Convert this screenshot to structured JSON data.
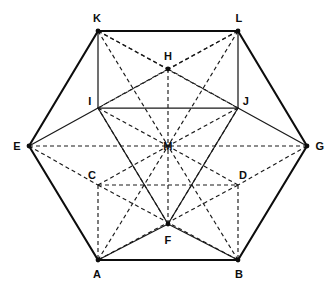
{
  "figure": {
    "background_color": "#ffffff",
    "line_color": "#1a1a1a",
    "outer_line_color": "#0d0d0d",
    "width": 332,
    "height": 286,
    "vertices": [
      {
        "id": "A",
        "label": "A",
        "x": 98,
        "y": 260,
        "label_x": 97,
        "label_y": 274,
        "dot": true
      },
      {
        "id": "B",
        "label": "B",
        "x": 238,
        "y": 260,
        "label_x": 239,
        "label_y": 274,
        "dot": true
      },
      {
        "id": "C",
        "label": "C",
        "x": 98,
        "y": 185,
        "label_x": 92,
        "label_y": 175,
        "dot": false
      },
      {
        "id": "D",
        "label": "D",
        "x": 238,
        "y": 185,
        "label_x": 243,
        "label_y": 175,
        "dot": false
      },
      {
        "id": "E",
        "label": "E",
        "x": 29,
        "y": 146,
        "label_x": 17,
        "label_y": 146,
        "dot": true
      },
      {
        "id": "F",
        "label": "F",
        "x": 168,
        "y": 224,
        "label_x": 168,
        "label_y": 240,
        "dot": true
      },
      {
        "id": "G",
        "label": "G",
        "x": 307,
        "y": 146,
        "label_x": 320,
        "label_y": 146,
        "dot": true
      },
      {
        "id": "H",
        "label": "H",
        "x": 168,
        "y": 69,
        "label_x": 168,
        "label_y": 56,
        "dot": true
      },
      {
        "id": "I",
        "label": "I",
        "x": 98,
        "y": 108,
        "label_x": 90,
        "label_y": 101,
        "dot": false
      },
      {
        "id": "J",
        "label": "J",
        "x": 238,
        "y": 108,
        "label_x": 246,
        "label_y": 101,
        "dot": false
      },
      {
        "id": "K",
        "label": "K",
        "x": 98,
        "y": 31,
        "label_x": 97,
        "label_y": 18,
        "dot": true
      },
      {
        "id": "L",
        "label": "L",
        "x": 238,
        "y": 31,
        "label_x": 239,
        "label_y": 18,
        "dot": true
      },
      {
        "id": "M",
        "label": "M",
        "x": 168,
        "y": 146,
        "label_x": 168,
        "label_y": 146,
        "dot": false
      }
    ],
    "edges_solid_outer": [
      {
        "from": "A",
        "to": "B",
        "name": "edge-A-B"
      },
      {
        "from": "B",
        "to": "G",
        "name": "edge-B-G"
      },
      {
        "from": "G",
        "to": "L",
        "name": "edge-G-L"
      },
      {
        "from": "L",
        "to": "K",
        "name": "edge-L-K"
      },
      {
        "from": "K",
        "to": "E",
        "name": "edge-K-E"
      },
      {
        "from": "E",
        "to": "A",
        "name": "edge-E-A"
      }
    ],
    "edges_solid_inner": [
      {
        "from": "K",
        "to": "I",
        "name": "edge-K-I"
      },
      {
        "from": "L",
        "to": "J",
        "name": "edge-L-J"
      },
      {
        "from": "I",
        "to": "J",
        "name": "edge-I-J"
      },
      {
        "from": "E",
        "to": "I",
        "name": "edge-E-I"
      },
      {
        "from": "G",
        "to": "J",
        "name": "edge-G-J"
      },
      {
        "from": "I",
        "to": "F",
        "name": "edge-I-F"
      },
      {
        "from": "J",
        "to": "F",
        "name": "edge-J-F"
      },
      {
        "from": "A",
        "to": "F",
        "name": "edge-A-F"
      },
      {
        "from": "B",
        "to": "F",
        "name": "edge-B-F"
      }
    ],
    "edges_dashed": [
      {
        "from": "K",
        "to": "H",
        "name": "edge-K-H"
      },
      {
        "from": "L",
        "to": "H",
        "name": "edge-L-H"
      },
      {
        "from": "K",
        "to": "J",
        "name": "edge-K-J"
      },
      {
        "from": "L",
        "to": "I",
        "name": "edge-L-I"
      },
      {
        "from": "K",
        "to": "M",
        "name": "edge-K-M"
      },
      {
        "from": "L",
        "to": "M",
        "name": "edge-L-M"
      },
      {
        "from": "H",
        "to": "M",
        "name": "edge-H-M"
      },
      {
        "from": "H",
        "to": "I",
        "name": "edge-H-I"
      },
      {
        "from": "H",
        "to": "J",
        "name": "edge-H-J"
      },
      {
        "from": "E",
        "to": "M",
        "name": "edge-E-M"
      },
      {
        "from": "G",
        "to": "M",
        "name": "edge-G-M"
      },
      {
        "from": "E",
        "to": "C",
        "name": "edge-E-C"
      },
      {
        "from": "G",
        "to": "D",
        "name": "edge-G-D"
      },
      {
        "from": "C",
        "to": "D",
        "name": "edge-C-D"
      },
      {
        "from": "C",
        "to": "A",
        "name": "edge-C-A"
      },
      {
        "from": "D",
        "to": "B",
        "name": "edge-D-B"
      },
      {
        "from": "C",
        "to": "M",
        "name": "edge-C-M"
      },
      {
        "from": "D",
        "to": "M",
        "name": "edge-D-M"
      },
      {
        "from": "C",
        "to": "B",
        "name": "edge-C-B"
      },
      {
        "from": "D",
        "to": "A",
        "name": "edge-D-A"
      },
      {
        "from": "F",
        "to": "M",
        "name": "edge-F-M"
      },
      {
        "from": "A",
        "to": "M",
        "name": "edge-A-M"
      },
      {
        "from": "B",
        "to": "M",
        "name": "edge-B-M"
      },
      {
        "from": "I",
        "to": "M",
        "name": "edge-I-M"
      },
      {
        "from": "J",
        "to": "M",
        "name": "edge-J-M"
      },
      {
        "from": "F",
        "to": "I",
        "name": "edge-F-I-hidden"
      },
      {
        "from": "F",
        "to": "J",
        "name": "edge-F-J-hidden"
      }
    ]
  }
}
